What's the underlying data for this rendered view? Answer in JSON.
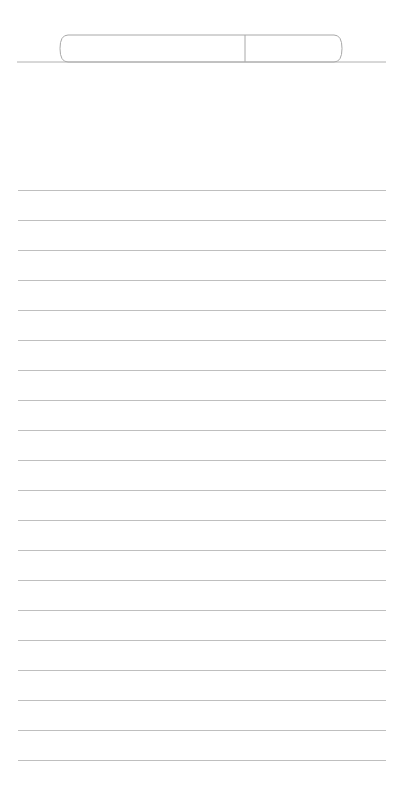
{
  "app": {
    "title": "Notepad",
    "surface_color": "#ffffff",
    "rule_color": "#bfbfbf",
    "outline_color": "#aaaaaa"
  },
  "header": {
    "name": "pen-tray",
    "divider_label": "",
    "baseline": {
      "name": "tray-baseline",
      "x_start": 17,
      "x_end": 386,
      "y": 62
    },
    "pen": {
      "name": "pen",
      "label": "",
      "x_start": 62,
      "x_end": 340,
      "y_top": 35,
      "y_bottom": 62,
      "cap_divider_x": 245,
      "outline_color": "#a8a8a8",
      "fill_color": "#ffffff"
    }
  },
  "paper": {
    "name": "ruled-paper",
    "line_count": 20,
    "line_spacing": 30,
    "first_line_y": 190,
    "left_margin": 18,
    "right_margin": 386,
    "lines": [
      {
        "index": 1,
        "y": 190,
        "text": ""
      },
      {
        "index": 2,
        "y": 220,
        "text": ""
      },
      {
        "index": 3,
        "y": 250,
        "text": ""
      },
      {
        "index": 4,
        "y": 280,
        "text": ""
      },
      {
        "index": 5,
        "y": 310,
        "text": ""
      },
      {
        "index": 6,
        "y": 340,
        "text": ""
      },
      {
        "index": 7,
        "y": 370,
        "text": ""
      },
      {
        "index": 8,
        "y": 400,
        "text": ""
      },
      {
        "index": 9,
        "y": 430,
        "text": ""
      },
      {
        "index": 10,
        "y": 460,
        "text": ""
      },
      {
        "index": 11,
        "y": 490,
        "text": ""
      },
      {
        "index": 12,
        "y": 520,
        "text": ""
      },
      {
        "index": 13,
        "y": 550,
        "text": ""
      },
      {
        "index": 14,
        "y": 580,
        "text": ""
      },
      {
        "index": 15,
        "y": 610,
        "text": ""
      },
      {
        "index": 16,
        "y": 640,
        "text": ""
      },
      {
        "index": 17,
        "y": 670,
        "text": ""
      },
      {
        "index": 18,
        "y": 700,
        "text": ""
      },
      {
        "index": 19,
        "y": 730,
        "text": ""
      },
      {
        "index": 20,
        "y": 760,
        "text": ""
      }
    ]
  }
}
